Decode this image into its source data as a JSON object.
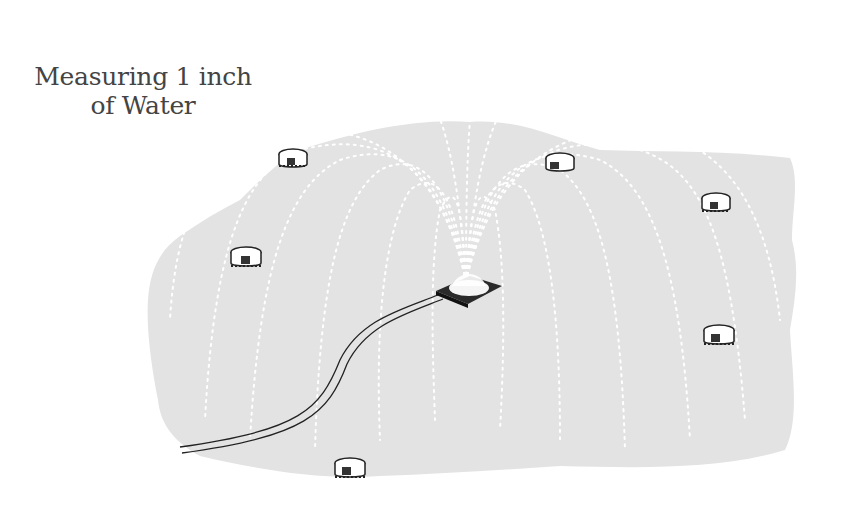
{
  "title": {
    "line1": "Measuring 1 inch",
    "line2": "of Water"
  },
  "illustration": {
    "subject": "sprinkler-with-catch-cans",
    "lawn_color": "#e3e3e3",
    "ink_color": "#222222",
    "spray_color": "#ffffff",
    "catch_can_count": 6,
    "catch_cans": [
      {
        "x": 293,
        "y": 158
      },
      {
        "x": 560,
        "y": 162
      },
      {
        "x": 716,
        "y": 202
      },
      {
        "x": 246,
        "y": 256
      },
      {
        "x": 719,
        "y": 334
      },
      {
        "x": 350,
        "y": 467
      }
    ],
    "sprinkler": {
      "x": 466,
      "y": 290
    }
  }
}
